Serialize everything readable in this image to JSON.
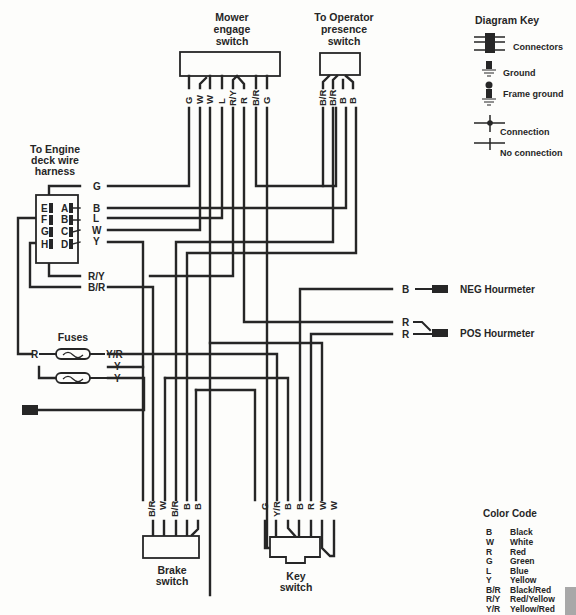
{
  "components": {
    "mower_engage_switch": {
      "title": [
        "Mower",
        "engage",
        "switch"
      ],
      "pins": [
        "G",
        "W",
        "W",
        "L",
        "R/Y",
        "R",
        "B/R",
        "G"
      ]
    },
    "operator_presence_switch": {
      "title": [
        "To Operator",
        "presence",
        "switch"
      ],
      "pins": [
        "B/R",
        "B/R",
        "B",
        "B"
      ]
    },
    "engine_deck_harness": {
      "title": [
        "To Engine",
        "deck wire",
        "harness"
      ],
      "left_pins": [
        "E",
        "F",
        "G",
        "H"
      ],
      "right_pins": [
        "A",
        "B",
        "C",
        "D"
      ],
      "wires": [
        "G",
        "B",
        "L",
        "W",
        "Y",
        "R/Y",
        "B/R"
      ]
    },
    "fuses": {
      "title": "Fuses",
      "fuse1": {
        "in": "R",
        "out": "Y/R"
      },
      "fuse2": {
        "in_top": "Y",
        "out": "Y"
      }
    },
    "hourmeter": {
      "neg_wire": "B",
      "neg_label": "NEG Hourmeter",
      "pos_wires": [
        "R",
        "R"
      ],
      "pos_label": "POS Hourmeter"
    },
    "brake_switch": {
      "title": [
        "Brake",
        "switch"
      ],
      "pins": [
        "B/R",
        "W",
        "B/R",
        "B",
        "B"
      ]
    },
    "key_switch": {
      "title": [
        "Key",
        "switch"
      ],
      "pins": [
        "G",
        "Y/R",
        "B",
        "B",
        "R",
        "W",
        "W"
      ]
    }
  },
  "diagram_key": {
    "title": "Diagram Key",
    "items": [
      {
        "icon": "connectors-icon",
        "label": "Connectors"
      },
      {
        "icon": "ground-icon",
        "label": "Ground"
      },
      {
        "icon": "frame-ground-icon",
        "label": "Frame ground"
      },
      {
        "icon": "connection-icon",
        "label": "Connection"
      },
      {
        "icon": "no-connection-icon",
        "label": "No connection"
      }
    ]
  },
  "color_code": {
    "title": "Color Code",
    "entries": [
      {
        "code": "B",
        "name": "Black"
      },
      {
        "code": "W",
        "name": "White"
      },
      {
        "code": "R",
        "name": "Red"
      },
      {
        "code": "G",
        "name": "Green"
      },
      {
        "code": "L",
        "name": "Blue"
      },
      {
        "code": "Y",
        "name": "Yellow"
      },
      {
        "code": "B/R",
        "name": "Black/Red"
      },
      {
        "code": "R/Y",
        "name": "Red/Yellow"
      },
      {
        "code": "Y/R",
        "name": "Yellow/Red"
      }
    ]
  }
}
